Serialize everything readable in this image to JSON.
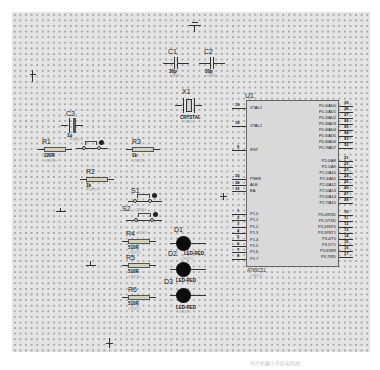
{
  "schematic": {
    "components": {
      "C1": {
        "ref": "C1",
        "value": "30p",
        "text": "<TEXT>"
      },
      "C2": {
        "ref": "C2",
        "value": "30p",
        "text": "<TEXT>"
      },
      "C3": {
        "ref": "C3",
        "value": "1u",
        "text": "<TEXT>"
      },
      "X1": {
        "ref": "X1",
        "value": "CRYSTAL",
        "text": "<TEXT>"
      },
      "R1": {
        "ref": "R1",
        "value": "220R",
        "text": "<TEXT>"
      },
      "R2": {
        "ref": "R2",
        "value": "1k",
        "text": "<TEXT>"
      },
      "R3": {
        "ref": "R3",
        "value": "1k",
        "text": "<TEXT>"
      },
      "R4": {
        "ref": "R4",
        "value": "510R",
        "text": "<TEXT>"
      },
      "R5": {
        "ref": "R5",
        "value": "510R",
        "text": "<TEXT>"
      },
      "R6": {
        "ref": "R6",
        "value": "510R",
        "text": "<TEXT>"
      },
      "S1": {
        "ref": "S1"
      },
      "S2": {
        "ref": "S2",
        "text": "<TEXT>"
      },
      "D1": {
        "ref": "D1",
        "value": "LED-RED",
        "text": "<TEXT>"
      },
      "D2": {
        "ref": "D2",
        "value": "LED-RED",
        "text": "<TEXT>"
      },
      "D3": {
        "ref": "D3",
        "value": "LED-RED",
        "text": "<TEXT>"
      }
    },
    "U1": {
      "ref": "U1",
      "part": "AT89C51",
      "text": "<TEXT>",
      "left_pins": [
        {
          "num": "19",
          "name": "XTAL1"
        },
        {
          "num": "18",
          "name": "XTAL2"
        },
        {
          "num": "9",
          "name": "RST"
        },
        {
          "num": "29",
          "name": "PSEN"
        },
        {
          "num": "30",
          "name": "ALE"
        },
        {
          "num": "31",
          "name": "EA"
        },
        {
          "num": "1",
          "name": "P1.0"
        },
        {
          "num": "2",
          "name": "P1.1"
        },
        {
          "num": "3",
          "name": "P1.2"
        },
        {
          "num": "4",
          "name": "P1.3"
        },
        {
          "num": "5",
          "name": "P1.4"
        },
        {
          "num": "6",
          "name": "P1.5"
        },
        {
          "num": "7",
          "name": "P1.6"
        },
        {
          "num": "8",
          "name": "P1.7"
        }
      ],
      "right_pins": [
        {
          "num": "39",
          "name": "P0.0/AD0"
        },
        {
          "num": "38",
          "name": "P0.1/AD1"
        },
        {
          "num": "37",
          "name": "P0.2/AD2"
        },
        {
          "num": "36",
          "name": "P0.3/AD3"
        },
        {
          "num": "35",
          "name": "P0.4/AD4"
        },
        {
          "num": "34",
          "name": "P0.5/AD5"
        },
        {
          "num": "33",
          "name": "P0.6/AD6"
        },
        {
          "num": "32",
          "name": "P0.7/AD7"
        },
        {
          "num": "21",
          "name": "P2.0/A8"
        },
        {
          "num": "22",
          "name": "P2.1/A9"
        },
        {
          "num": "23",
          "name": "P2.2/A10"
        },
        {
          "num": "24",
          "name": "P2.3/A11"
        },
        {
          "num": "25",
          "name": "P2.4/A12"
        },
        {
          "num": "26",
          "name": "P2.5/A13"
        },
        {
          "num": "27",
          "name": "P2.6/A14"
        },
        {
          "num": "28",
          "name": "P2.7/A15"
        },
        {
          "num": "10",
          "name": "P3.0/RXD"
        },
        {
          "num": "11",
          "name": "P3.1/TXD"
        },
        {
          "num": "12",
          "name": "P3.2/INT0"
        },
        {
          "num": "13",
          "name": "P3.3/INT1"
        },
        {
          "num": "14",
          "name": "P3.4/T0"
        },
        {
          "num": "15",
          "name": "P3.5/T1"
        },
        {
          "num": "16",
          "name": "P3.6/WR"
        },
        {
          "num": "17",
          "name": "P3.7/RD"
        }
      ]
    },
    "caption": "单片机最小系统电路图"
  },
  "colors": {
    "sheet": "#e4e4e4",
    "chip_body": "#d9d9d9",
    "led": "#0d0d0d",
    "wire": "#333333",
    "resistor_body": "#d6d0b8"
  }
}
